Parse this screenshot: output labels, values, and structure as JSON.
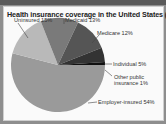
{
  "title": "Health insurance coverage in the United States (2007)",
  "chart_data": {
    "type": "pie",
    "title": "Health insurance coverage in the United States (2007)",
    "categories": [
      "Employer-insured",
      "Uninsured",
      "Medicaid",
      "Medicare",
      "Individual",
      "Other public insurance"
    ],
    "values": [
      54,
      15,
      13,
      12,
      5,
      1
    ],
    "units": "%",
    "colors": [
      "#9a9a9a",
      "#b9b9b9",
      "#7a7a7a",
      "#555555",
      "#333333",
      "#111111"
    ],
    "legend": "none (direct labels with leader lines)"
  },
  "labels": {
    "uninsured": "Uninsured  15%",
    "medicaid": "Medicaid  13%",
    "medicare": "Medicare  12%",
    "individual": "Individual  5%",
    "other_line1": "Other public",
    "other_line2": "insurance  1%",
    "employer": "Employer-insured  54%"
  }
}
